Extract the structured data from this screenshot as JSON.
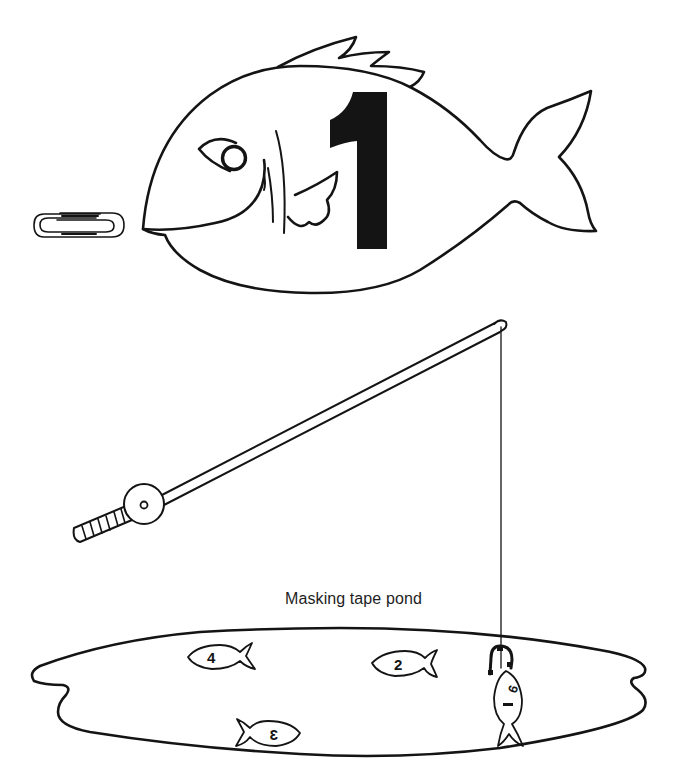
{
  "illustration": {
    "big_fish": {
      "number_label": "1",
      "icon": "fish-outline"
    },
    "paperclip": {
      "icon": "paperclip"
    },
    "fishing_rod": {
      "icon": "fishing-rod-with-reel"
    },
    "caption": "Masking tape pond",
    "pond": {
      "fish": [
        {
          "number_label": "4",
          "facing": "left"
        },
        {
          "number_label": "2",
          "facing": "left"
        },
        {
          "number_label": "3",
          "facing": "right",
          "mirrored": true
        },
        {
          "number_label": "6",
          "state": "hooked",
          "facing": "up"
        }
      ]
    },
    "colors": {
      "ink": "#141414",
      "paper": "#ffffff"
    }
  }
}
